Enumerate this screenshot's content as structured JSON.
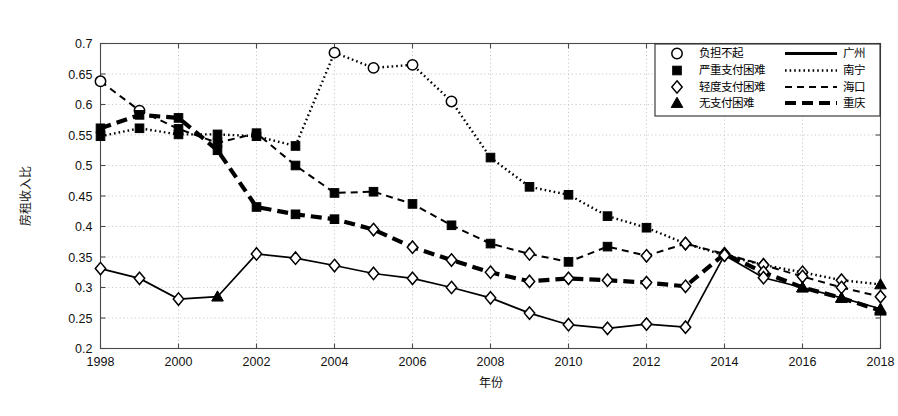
{
  "figure": {
    "background": "#ffffff",
    "plot_border_color": "#4a4a4a",
    "grid_color": "#bdbdbd",
    "ink": "#000000"
  },
  "axes": {
    "ylabel": "房租收入比",
    "xlabel": "年份",
    "y_ticks": [
      "0.2",
      "0.25",
      "0.3",
      "0.35",
      "0.4",
      "0.45",
      "0.5",
      "0.55",
      "0.6",
      "0.65",
      "0.7"
    ],
    "x_ticks": [
      "1998",
      "2000",
      "2002",
      "2004",
      "2006",
      "2008",
      "2010",
      "2012",
      "2014",
      "2016",
      "2018"
    ]
  },
  "legend": {
    "marker_entries": [
      {
        "marker": "circle-marker",
        "label": "负担不起"
      },
      {
        "marker": "square-marker",
        "label": "严重支付困难"
      },
      {
        "marker": "diamond-marker",
        "label": "轻度支付困难"
      },
      {
        "marker": "triangle-marker",
        "label": "无支付困难"
      }
    ],
    "line_entries": [
      {
        "style": "solid-line",
        "label": "广州"
      },
      {
        "style": "dotted-line",
        "label": "南宁"
      },
      {
        "style": "dashed-line",
        "label": "海口"
      },
      {
        "style": "thick-dash-line",
        "label": "重庆"
      }
    ]
  },
  "chart_data": {
    "type": "line",
    "title": "",
    "xlabel": "年份",
    "ylabel": "房租收入比",
    "xlim": [
      1998,
      2018
    ],
    "ylim": [
      0.2,
      0.7
    ],
    "yticks": [
      0.2,
      0.25,
      0.3,
      0.35,
      0.4,
      0.45,
      0.5,
      0.55,
      0.6,
      0.65,
      0.7
    ],
    "xticks": [
      1998,
      2000,
      2002,
      2004,
      2006,
      2008,
      2010,
      2012,
      2014,
      2016,
      2018
    ],
    "grid": true,
    "legend_position": "top-right",
    "x": [
      1998,
      1999,
      2000,
      2001,
      2002,
      2003,
      2004,
      2005,
      2006,
      2007,
      2008,
      2009,
      2010,
      2011,
      2012,
      2013,
      2014,
      2015,
      2016,
      2017,
      2018
    ],
    "marker_meaning": {
      "circle": "负担不起",
      "square": "严重支付困难",
      "diamond": "轻度支付困难",
      "triangle": "无支付困难"
    },
    "series": [
      {
        "name": "南宁",
        "line_style": "dotted",
        "values": [
          0.548,
          0.561,
          0.551,
          0.551,
          0.548,
          0.532,
          0.685,
          0.66,
          0.665,
          0.605,
          0.513,
          0.465,
          0.452,
          0.417,
          0.398,
          0.372,
          0.353,
          0.337,
          0.325,
          0.312,
          0.305
        ],
        "markers": [
          "square",
          "square",
          "square",
          "square",
          "square",
          "square",
          "circle",
          "circle",
          "circle",
          "circle",
          "square",
          "square",
          "square",
          "square",
          "square",
          "diamond",
          "diamond",
          "diamond",
          "diamond",
          "diamond",
          "triangle"
        ]
      },
      {
        "name": "海口",
        "line_style": "dashed",
        "values": [
          0.638,
          0.59,
          0.56,
          0.537,
          0.553,
          0.5,
          0.455,
          0.457,
          0.437,
          0.402,
          0.372,
          0.355,
          0.342,
          0.367,
          0.352,
          0.372,
          0.355,
          0.337,
          0.318,
          0.3,
          0.285
        ],
        "markers": [
          "circle",
          "circle",
          "square",
          "square",
          "square",
          "square",
          "square",
          "square",
          "square",
          "square",
          "square",
          "diamond",
          "square",
          "square",
          "diamond",
          "diamond",
          "diamond",
          "diamond",
          "diamond",
          "diamond",
          "diamond"
        ]
      },
      {
        "name": "重庆",
        "line_style": "thick-dash",
        "values": [
          0.561,
          0.583,
          0.578,
          0.525,
          0.432,
          0.42,
          0.412,
          0.395,
          0.366,
          0.345,
          0.325,
          0.31,
          0.315,
          0.312,
          0.308,
          0.302,
          0.355,
          0.325,
          0.3,
          0.283,
          0.262
        ],
        "markers": [
          "square",
          "square",
          "square",
          "square",
          "square",
          "square",
          "square",
          "diamond",
          "diamond",
          "diamond",
          "diamond",
          "diamond",
          "diamond",
          "diamond",
          "diamond",
          "diamond",
          "diamond",
          "diamond",
          "triangle",
          "triangle",
          "triangle"
        ]
      },
      {
        "name": "广州",
        "line_style": "solid",
        "values": [
          0.331,
          0.315,
          0.281,
          0.285,
          0.355,
          0.348,
          0.336,
          0.323,
          0.315,
          0.3,
          0.283,
          0.258,
          0.239,
          0.233,
          0.24,
          0.235,
          0.353,
          0.316,
          0.3,
          0.283,
          0.265
        ],
        "markers": [
          "diamond",
          "diamond",
          "diamond",
          "triangle",
          "diamond",
          "diamond",
          "diamond",
          "diamond",
          "diamond",
          "diamond",
          "diamond",
          "diamond",
          "diamond",
          "diamond",
          "diamond",
          "diamond",
          "diamond",
          "diamond",
          "triangle",
          "triangle",
          "triangle"
        ]
      }
    ]
  }
}
